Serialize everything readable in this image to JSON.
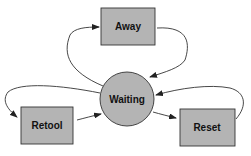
{
  "diagram": {
    "type": "state-diagram",
    "nodes": [
      {
        "id": "away",
        "label": "Away",
        "shape": "rect"
      },
      {
        "id": "waiting",
        "label": "Waiting",
        "shape": "circle"
      },
      {
        "id": "retool",
        "label": "Retool",
        "shape": "rect"
      },
      {
        "id": "reset",
        "label": "Reset",
        "shape": "rect"
      }
    ],
    "edges": [
      {
        "from": "waiting",
        "to": "away"
      },
      {
        "from": "away",
        "to": "waiting"
      },
      {
        "from": "waiting",
        "to": "retool"
      },
      {
        "from": "retool",
        "to": "waiting"
      },
      {
        "from": "waiting",
        "to": "reset"
      },
      {
        "from": "reset",
        "to": "waiting"
      }
    ],
    "colors": {
      "fill": "#b4b4b4",
      "stroke": "#333333"
    }
  }
}
